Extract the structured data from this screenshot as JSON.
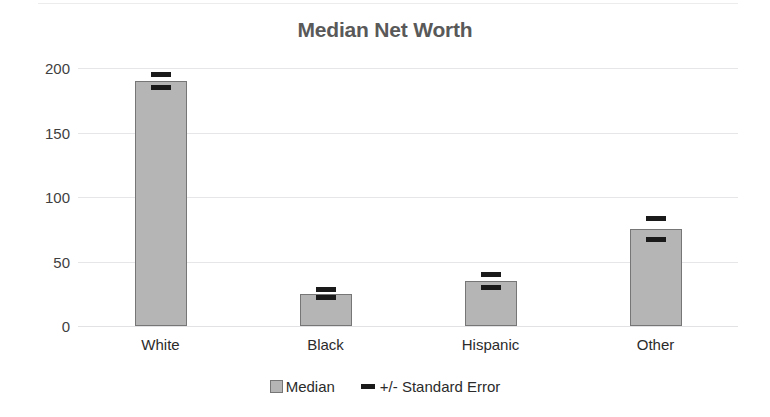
{
  "chart_data": {
    "type": "bar",
    "title": "Median Net Worth",
    "xlabel": "",
    "ylabel": "",
    "categories": [
      "White",
      "Black",
      "Hispanic",
      "Other"
    ],
    "values": [
      190,
      25,
      35,
      75
    ],
    "errors": [
      5,
      3,
      5,
      8
    ],
    "series": [
      {
        "name": "Median",
        "values": [
          190,
          25,
          35,
          75
        ]
      },
      {
        "name": "+/- Standard Error",
        "values": [
          5,
          3,
          5,
          8
        ]
      }
    ],
    "ylim": [
      0,
      200
    ],
    "yticks": [
      0,
      50,
      100,
      150,
      200
    ],
    "ytick_labels": [
      "0",
      "50",
      "100",
      "150",
      "200"
    ],
    "grid": true,
    "legend_position": "bottom",
    "colors": {
      "bar_fill": "#b5b5b5",
      "bar_border": "#767676",
      "error_marker": "#1a1a1a",
      "title_text": "#595959",
      "axis_text": "#2b2b2b",
      "gridline": "#e6e6e8",
      "background": "#ffffff"
    }
  },
  "legend": {
    "items": [
      {
        "label": "Median",
        "marker": "median-swatch"
      },
      {
        "label": "+/- Standard Error",
        "marker": "error-bar-swatch"
      }
    ]
  }
}
